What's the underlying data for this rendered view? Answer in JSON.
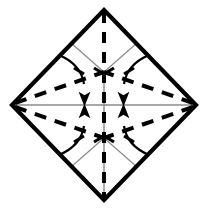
{
  "diagram": {
    "type": "origami-fold-instruction",
    "canvas": {
      "width": 207,
      "height": 212,
      "background": "#ffffff"
    },
    "colors": {
      "outline": "#000000",
      "fold_line": "#000000",
      "guide_line": "#8a8a8a",
      "arrow": "#000000",
      "paper": "#ffffff"
    },
    "sheet": {
      "name": "square-sheet-rotated",
      "shape": "diamond",
      "stroke_width": 4.2,
      "vertices": {
        "top": {
          "x": 104,
          "y": 10
        },
        "right": {
          "x": 196,
          "y": 105
        },
        "bottom": {
          "x": 104,
          "y": 200
        },
        "left": {
          "x": 12,
          "y": 105
        }
      },
      "points": "104,10 196,105 104,200 12,105"
    },
    "center": {
      "x": 104,
      "y": 105
    },
    "node_upper": {
      "x": 104,
      "y": 72
    },
    "node_lower": {
      "x": 104,
      "y": 138
    },
    "guide_lines": [
      {
        "name": "guide-horizontal-axis",
        "x1": 14,
        "y1": 105,
        "x2": 194,
        "y2": 105,
        "width": 1.4
      },
      {
        "name": "guide-vertical-lower",
        "x1": 104,
        "y1": 72,
        "x2": 104,
        "y2": 198,
        "width": 1.4
      },
      {
        "name": "guide-upper-left-diagonal",
        "x1": 71,
        "y1": 43,
        "x2": 104,
        "y2": 72,
        "width": 1.2
      },
      {
        "name": "guide-upper-right-diagonal",
        "x1": 137,
        "y1": 43,
        "x2": 104,
        "y2": 72,
        "width": 1.2
      },
      {
        "name": "guide-lower-left-diagonal",
        "x1": 71,
        "y1": 167,
        "x2": 104,
        "y2": 138,
        "width": 1.2
      },
      {
        "name": "guide-lower-right-diagonal",
        "x1": 137,
        "y1": 167,
        "x2": 104,
        "y2": 138,
        "width": 1.2
      }
    ],
    "fold_lines": [
      {
        "name": "fold-vertical-center",
        "kind": "dashed-vertical",
        "x1": 104,
        "y1": 12,
        "x2": 104,
        "y2": 198,
        "width": 4.0,
        "dash": "11 9"
      },
      {
        "name": "fold-left-to-upper-node",
        "kind": "dashed-diagonal",
        "x1": 15,
        "y1": 103,
        "x2": 104,
        "y2": 72,
        "width": 4.0,
        "dash": "12 9"
      },
      {
        "name": "fold-left-to-lower-node",
        "kind": "dashed-diagonal",
        "x1": 15,
        "y1": 107,
        "x2": 104,
        "y2": 138,
        "width": 4.0,
        "dash": "12 9"
      },
      {
        "name": "fold-right-to-upper-node",
        "kind": "dashed-diagonal",
        "x1": 193,
        "y1": 103,
        "x2": 104,
        "y2": 72,
        "width": 4.0,
        "dash": "12 9"
      },
      {
        "name": "fold-right-to-lower-node",
        "kind": "dashed-diagonal",
        "x1": 193,
        "y1": 107,
        "x2": 104,
        "y2": 138,
        "width": 4.0,
        "dash": "12 9"
      }
    ],
    "motion_arrows": [
      {
        "name": "arrow-upper-left-fold-down",
        "direction": "down",
        "path": "M 59,55 C 73,61 82,70 84,84",
        "width": 2.2,
        "head": {
          "x": 84.5,
          "y": 97,
          "angle": 90,
          "size": 9.5
        },
        "tick": {
          "x1": 74,
          "y1": 68,
          "x2": 84,
          "y2": 74
        }
      },
      {
        "name": "arrow-upper-right-fold-down",
        "direction": "down",
        "path": "M 149,55 C 135,61 126,70 124,84",
        "width": 2.2,
        "head": {
          "x": 123.5,
          "y": 97,
          "angle": 90,
          "size": 9.5
        },
        "tick": {
          "x1": 134,
          "y1": 68,
          "x2": 124,
          "y2": 74
        }
      },
      {
        "name": "arrow-lower-left-fold-up",
        "direction": "up",
        "path": "M 59,155 C 73,149 82,140 84,126",
        "width": 2.2,
        "head": {
          "x": 84.5,
          "y": 113,
          "angle": 270,
          "size": 9.5
        },
        "tick": {
          "x1": 74,
          "y1": 142,
          "x2": 84,
          "y2": 136
        }
      },
      {
        "name": "arrow-lower-right-fold-up",
        "direction": "up",
        "path": "M 149,155 C 135,149 126,140 124,126",
        "width": 2.2,
        "head": {
          "x": 123.5,
          "y": 113,
          "angle": 270,
          "size": 9.5
        },
        "tick": {
          "x1": 134,
          "y1": 142,
          "x2": 124,
          "y2": 136
        }
      }
    ],
    "node_ticks": [
      {
        "name": "node-tick-upper-left",
        "x1": 94,
        "y1": 68,
        "x2": 104,
        "y2": 74
      },
      {
        "name": "node-tick-upper-right",
        "x1": 114,
        "y1": 68,
        "x2": 104,
        "y2": 74
      },
      {
        "name": "node-tick-lower-left",
        "x1": 94,
        "y1": 142,
        "x2": 104,
        "y2": 136
      },
      {
        "name": "node-tick-lower-right",
        "x1": 114,
        "y1": 142,
        "x2": 104,
        "y2": 136
      }
    ]
  }
}
